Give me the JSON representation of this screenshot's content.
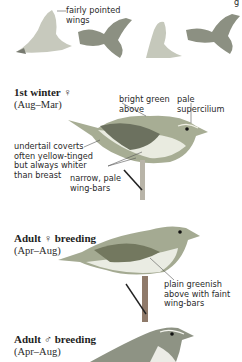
{
  "flight_row": {
    "annotation": "fairly pointed\nwings",
    "corner_fragment": "g"
  },
  "sections": [
    {
      "heading": "1st winter ♀",
      "dates": "(Aug–Mar)",
      "annotations": [
        {
          "text": "bright green\nabove"
        },
        {
          "text": "pale\nsupercilium"
        },
        {
          "text": "undertail coverts\noften yellow-tinged\nbut always whiter\nthan breast"
        },
        {
          "text": "narrow, pale\nwing-bars"
        }
      ]
    },
    {
      "heading": "Adult ♀ breeding",
      "dates": "(Apr–Aug)",
      "annotations": [
        {
          "text": "plain greenish\nabove with faint\nwing-bars"
        }
      ]
    },
    {
      "heading": "Adult ♂ breeding",
      "dates": "(Apr–Aug)",
      "annotations": []
    }
  ],
  "colors": {
    "bird_back": "#9aa08a",
    "bird_belly": "#e8e8de",
    "bird_wing": "#6f7466",
    "leader_line": "#555555"
  }
}
